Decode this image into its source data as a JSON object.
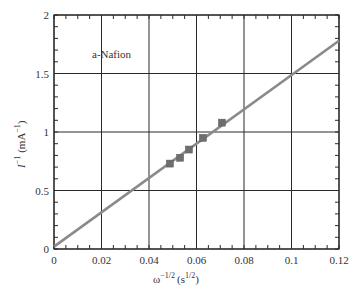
{
  "chart_data": {
    "type": "scatter",
    "title": "",
    "annotation": "a-Nafion",
    "xlabel": "ω^-1/2 (s^1/2)",
    "ylabel": "I^-1 (mA^-1)",
    "xlim": [
      0,
      0.12
    ],
    "ylim": [
      0,
      2
    ],
    "x_ticks": [
      "0",
      "0.02",
      "0.04",
      "0.06",
      "0.08",
      "0.1",
      "0.12"
    ],
    "y_ticks": [
      "0",
      "0.5",
      "1",
      "1.5",
      "2"
    ],
    "grid": true,
    "legend": null,
    "series": [
      {
        "name": "a-Nafion data",
        "marker": "square",
        "color": "#6e6e6e",
        "x": [
          0.0488,
          0.0531,
          0.0568,
          0.0627,
          0.0707
        ],
        "y": [
          0.73,
          0.78,
          0.85,
          0.95,
          1.08
        ]
      },
      {
        "name": "linear fit",
        "type": "line",
        "color": "#8a8a8a",
        "x": [
          0,
          0.12
        ],
        "y": [
          0.02,
          1.78
        ]
      }
    ]
  },
  "labels": {
    "annotation": "a-Nafion",
    "x_axis_main": "ω",
    "x_axis_sup": "−1/2",
    "x_axis_unit_open": "(s",
    "x_axis_unit_sup": "1/2",
    "x_axis_unit_close": ")",
    "y_axis_main": "I",
    "y_axis_sup": "−1",
    "y_axis_unit": "(mA",
    "y_axis_unit_sup": "−1",
    "y_axis_unit_close": ")"
  }
}
